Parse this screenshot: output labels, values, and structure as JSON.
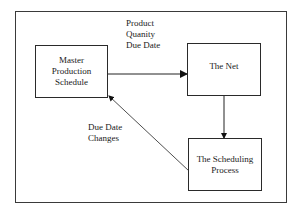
{
  "diagram": {
    "nodes": [
      {
        "id": "mps",
        "label_lines": [
          "Master",
          "Production",
          "Schedule"
        ]
      },
      {
        "id": "net",
        "label_lines": [
          "The Net"
        ]
      },
      {
        "id": "sched",
        "label_lines": [
          "The Scheduling",
          "Process"
        ]
      }
    ],
    "edges": [
      {
        "from": "mps",
        "to": "net",
        "label_lines": [
          "Product",
          "Quanity",
          "Due Date"
        ]
      },
      {
        "from": "net",
        "to": "sched",
        "label_lines": []
      },
      {
        "from": "sched",
        "to": "mps",
        "label_lines": [
          "Due Date",
          "Changes"
        ]
      }
    ]
  }
}
